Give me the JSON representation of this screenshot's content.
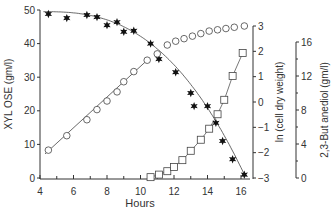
{
  "chart_data": {
    "type": "scatter",
    "title": "",
    "xlabel": "Hours",
    "xlim": [
      4,
      16.6
    ],
    "xticks": [
      4,
      6,
      8,
      10,
      12,
      14,
      16
    ],
    "axes": [
      {
        "id": "left",
        "label": "XYL OSE (gm/l)",
        "range": [
          0,
          50
        ],
        "ticks": [
          0,
          10,
          20,
          30,
          40,
          50
        ]
      },
      {
        "id": "right1",
        "label": "ln (cell dry weight)",
        "range": [
          -3,
          3
        ],
        "ticks": [
          -3,
          -2,
          -1,
          0,
          1,
          2,
          3
        ]
      },
      {
        "id": "right2",
        "label": "2,3-But anediol (gm/l)",
        "range": [
          0,
          16
        ],
        "ticks": [
          0,
          4,
          8,
          12,
          16
        ]
      }
    ],
    "series": [
      {
        "name": "Xylose",
        "axis": "left",
        "marker": "star",
        "x": [
          4.5,
          5.6,
          6.8,
          7.4,
          8.0,
          8.6,
          9.0,
          9.6,
          10.6,
          11.1,
          12.1,
          13.0,
          13.2,
          14.0,
          14.5,
          14.9,
          15.5,
          16.2
        ],
        "y": [
          48.8,
          47.6,
          48.5,
          47.9,
          45.5,
          46.4,
          43.5,
          43.8,
          40.0,
          35.4,
          31.5,
          25.3,
          21.4,
          21.4,
          16.4,
          11.0,
          5.6,
          1.0
        ]
      },
      {
        "name": "ln (cell dry weight)",
        "axis": "right1",
        "marker": "open-circle",
        "x": [
          4.5,
          5.6,
          6.8,
          7.4,
          8.0,
          8.6,
          9.0,
          9.6,
          10.4,
          11.0,
          11.6,
          12.1,
          12.6,
          13.1,
          13.6,
          14.1,
          14.6,
          15.1,
          15.6,
          16.2
        ],
        "y": [
          -1.9,
          -1.33,
          -0.7,
          -0.3,
          0.04,
          0.4,
          0.8,
          1.2,
          1.65,
          1.9,
          2.25,
          2.4,
          2.5,
          2.6,
          2.7,
          2.8,
          2.85,
          2.9,
          2.95,
          3.0
        ]
      },
      {
        "name": "2,3-Butanediol",
        "axis": "right2",
        "marker": "open-square",
        "x": [
          10.6,
          11.1,
          11.6,
          12.0,
          12.5,
          13.0,
          13.6,
          14.1,
          14.6,
          15.0,
          15.5,
          16.1
        ],
        "y": [
          0.1,
          0.4,
          0.8,
          1.3,
          2.1,
          3.2,
          4.5,
          5.8,
          7.5,
          9.2,
          12.0,
          14.7
        ]
      }
    ],
    "grid": false,
    "legend": "none"
  }
}
